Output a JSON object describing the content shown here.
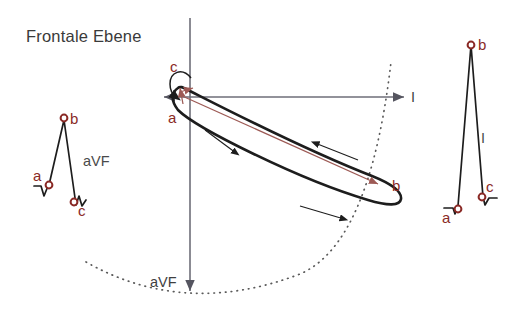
{
  "figure": {
    "title": "Frontale Ebene",
    "colors": {
      "marker_red": "#8a2a26",
      "vector_red": "#9d5a55",
      "loop_black": "#1d1d1d",
      "axis_gray": "#6e6e78",
      "arc_dotted": "#5a5a5a",
      "text_gray": "#3a3a3a",
      "background": "#ffffff"
    }
  },
  "axes": {
    "horizontal_label": "I",
    "vertical_label": "aVF",
    "origin": {
      "x": 188,
      "y": 97
    }
  },
  "loop": {
    "points": [
      {
        "id": "a",
        "label": "a",
        "x": 176,
        "y": 116
      },
      {
        "id": "b",
        "label": "b",
        "x": 383,
        "y": 188
      },
      {
        "id": "c",
        "label": "c",
        "x": 177,
        "y": 71
      }
    ],
    "direction": "counterclockwise",
    "arrow_count": 3
  },
  "waveform_left": {
    "lead_label": "aVF",
    "points": [
      {
        "id": "a",
        "label": "a",
        "x": 43,
        "y": 184
      },
      {
        "id": "b",
        "label": "b",
        "x": 64,
        "y": 118
      },
      {
        "id": "c",
        "label": "c",
        "x": 75,
        "y": 203
      }
    ]
  },
  "waveform_right": {
    "lead_label": "I",
    "points": [
      {
        "id": "a",
        "label": "a",
        "x": 456,
        "y": 209
      },
      {
        "id": "b",
        "label": "b",
        "x": 471,
        "y": 45
      },
      {
        "id": "c",
        "label": "c",
        "x": 481,
        "y": 197
      }
    ]
  }
}
